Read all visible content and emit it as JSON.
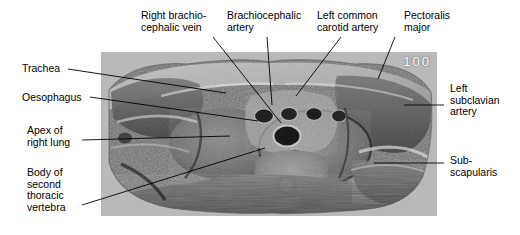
{
  "figure": {
    "number": "100",
    "panel": {
      "background_color": "#b9b9b9",
      "x": 101,
      "y": 52,
      "width": 336,
      "height": 164
    },
    "label_color": "#000000",
    "leader_color": "#000000"
  },
  "labels": [
    {
      "name": "right-brachiocephalic-vein",
      "text": "Right brachio-\ncephalic vein",
      "x": 141,
      "y": 10
    },
    {
      "name": "brachiocephalic-artery",
      "text": "Brachiocephalic\nartery",
      "x": 227,
      "y": 10
    },
    {
      "name": "left-common-carotid-artery",
      "text": "Left common\ncarotid artery",
      "x": 317,
      "y": 10
    },
    {
      "name": "pectoralis-major",
      "text": "Pectoralis\nmajor",
      "x": 404,
      "y": 10
    },
    {
      "name": "trachea",
      "text": "Trachea",
      "x": 22,
      "y": 63
    },
    {
      "name": "oesophagus",
      "text": "Oesophagus",
      "x": 22,
      "y": 92
    },
    {
      "name": "apex-of-right-lung",
      "text": "Apex of\nright lung",
      "x": 27,
      "y": 125
    },
    {
      "name": "body-of-second-thoracic-vertebra",
      "text": "Body of\nsecond\nthoracic\nvertebra",
      "x": 27,
      "y": 167
    },
    {
      "name": "left-subclavian-artery",
      "text": "Left\nsubclavian\nartery",
      "x": 450,
      "y": 83
    },
    {
      "name": "sub-scapularis",
      "text": "Sub-\nscapularis",
      "x": 450,
      "y": 155
    }
  ],
  "leader_lines": [
    {
      "name": "leader-right-brachiocephalic-vein",
      "x1": 213,
      "y1": 37,
      "x2": 281,
      "y2": 123
    },
    {
      "name": "leader-brachiocephalic-artery",
      "x1": 267,
      "y1": 37,
      "x2": 272,
      "y2": 105
    },
    {
      "name": "leader-left-common-carotid-artery",
      "x1": 341,
      "y1": 37,
      "x2": 296,
      "y2": 96
    },
    {
      "name": "leader-pectoralis-major",
      "x1": 395,
      "y1": 37,
      "x2": 378,
      "y2": 79
    },
    {
      "name": "leader-trachea",
      "x1": 68,
      "y1": 69,
      "x2": 226,
      "y2": 93
    },
    {
      "name": "leader-oesophagus",
      "x1": 90,
      "y1": 97,
      "x2": 258,
      "y2": 121
    },
    {
      "name": "leader-apex-of-right-lung",
      "x1": 82,
      "y1": 140,
      "x2": 230,
      "y2": 136
    },
    {
      "name": "leader-body-of-second-thoracic-vertebra",
      "x1": 82,
      "y1": 205,
      "x2": 265,
      "y2": 148
    },
    {
      "name": "leader-left-subclavian-artery",
      "x1": 444,
      "y1": 105,
      "x2": 404,
      "y2": 105
    },
    {
      "name": "leader-sub-scapularis",
      "x1": 444,
      "y1": 163,
      "x2": 374,
      "y2": 163
    }
  ],
  "anatomy_regions": [
    {
      "name": "trachea",
      "description": "central airway lumen"
    },
    {
      "name": "oesophagus",
      "description": "posterior to trachea"
    },
    {
      "name": "right-lung-apex",
      "description": "left of midline in image"
    },
    {
      "name": "t2-vertebral-body",
      "description": "posterior midline bone"
    },
    {
      "name": "spinal-canal",
      "description": "cord within canal"
    },
    {
      "name": "pectoralis-major",
      "description": "anterolateral chest wall muscle"
    },
    {
      "name": "subscapularis",
      "description": "posterior scapular muscle"
    },
    {
      "name": "left-subclavian-artery",
      "description": "left lateral great vessel"
    },
    {
      "name": "brachiocephalic-artery",
      "description": "anterior midline great vessel"
    },
    {
      "name": "left-common-carotid-artery",
      "description": "left of brachiocephalic"
    },
    {
      "name": "right-brachiocephalic-vein",
      "description": "right anterior venous channel"
    }
  ]
}
